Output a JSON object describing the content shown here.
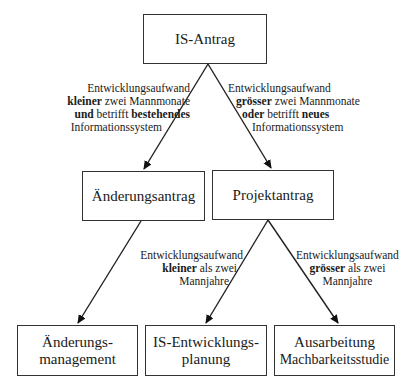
{
  "nodes": {
    "is_antrag": {
      "label": "IS-Antrag"
    },
    "aenderungsantrag": {
      "label": "Änderungsantrag"
    },
    "projektantrag": {
      "label": "Projektantrag"
    },
    "aenderungsmanagement": {
      "line1": "Änderungs-",
      "line2": "management"
    },
    "is_entwicklungsplanung": {
      "line1": "IS-Entwicklungs-",
      "line2": "planung"
    },
    "machbarkeitsstudie": {
      "line1": "Ausarbeitung",
      "line2": "Machbarkeitsstudie"
    }
  },
  "edges": {
    "to_aenderungsantrag": {
      "line1": "Entwicklungsaufwand",
      "line2_bold": "kleiner",
      "line2_rest": " zwei Mannmonate",
      "line3_bold1": "und",
      "line3_mid": " betrifft ",
      "line3_bold2": "bestehendes",
      "line4": "Informationssystem"
    },
    "to_projektantrag": {
      "line1": "Entwicklungsaufwand",
      "line2_bold": "grösser",
      "line2_rest": " zwei Mannmonate",
      "line3_bold1": "oder",
      "line3_mid": " betrifft ",
      "line3_bold2": "neues",
      "line4": "Informationssystem"
    },
    "to_entwicklungsplanung": {
      "line1": "Entwicklungsaufwand",
      "line2_bold": "kleiner",
      "line2_rest": " als zwei",
      "line3": "Mannjahre"
    },
    "to_machbarkeitsstudie": {
      "line1": "Entwicklungsaufwand",
      "line2_bold": "grösser",
      "line2_rest": " als zwei",
      "line3": "Mannjahre"
    }
  },
  "colors": {
    "stroke": "#333333",
    "text": "#1a1a1a",
    "background": "#ffffff"
  }
}
